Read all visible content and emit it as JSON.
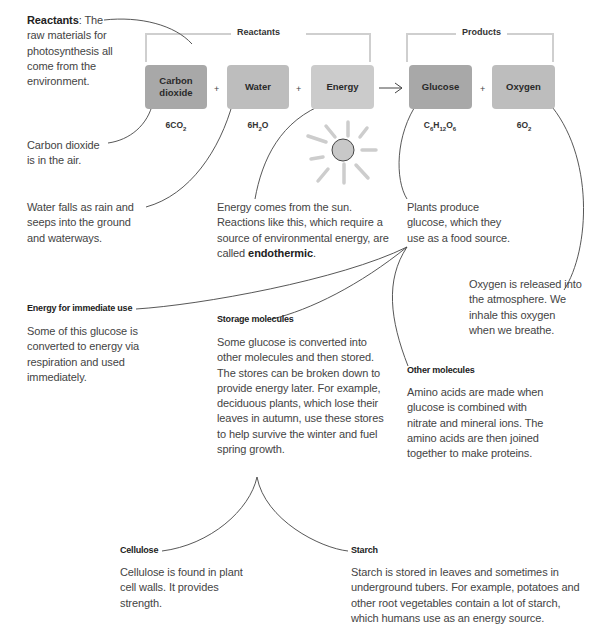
{
  "groups": {
    "reactants_label": "Reactants",
    "products_label": "Products"
  },
  "equation": {
    "boxes": [
      {
        "label": "Carbon dioxide",
        "line1": "Carbon",
        "line2": "dioxide",
        "formula_main": "6CO",
        "formula_sub": "2"
      },
      {
        "label": "Water",
        "formula_a": "6H",
        "formula_sub": "2",
        "formula_b": "O"
      },
      {
        "label": "Energy"
      },
      {
        "label": "Glucose",
        "formula": "C6H12O6"
      },
      {
        "label": "Oxygen",
        "formula_main": "6O",
        "formula_sub": "2"
      }
    ],
    "plus": "+",
    "arrow": "→",
    "colors": {
      "dark": "#a8a8a8",
      "mid": "#bdbdbd",
      "light": "#cbcbcb",
      "sun": "#c8c8c8"
    }
  },
  "annotations": {
    "reactants_term": "Reactants",
    "reactants_rest": ": The raw materials for photosynthesis all come from the environment.",
    "co2": "Carbon dioxide is in the air.",
    "water": "Water falls as rain and seeps into the ground and waterways.",
    "energy_pre": "Energy comes from the sun. Reactions like this, which require a source of environmental energy, are called ",
    "energy_term": "endothermic",
    "energy_post": ".",
    "glucose": "Plants produce glucose, which they use as a food source.",
    "oxygen": "Oxygen is released into the atmosphere. We inhale this oxygen when we breathe."
  },
  "uses": [
    {
      "heading": "Energy for immediate use",
      "text": "Some of this glucose is converted to energy via respiration and used immediately."
    },
    {
      "heading": "Storage molecules",
      "text": "Some glucose is converted into other molecules and then stored. The stores can be broken down to provide energy later. For example, deciduous plants, which lose their leaves in autumn, use these stores to help survive the winter and fuel spring growth."
    },
    {
      "heading": "Other molecules",
      "text": "Amino acids are made when glucose is combined with nitrate and mineral ions. The amino acids are then joined together to make proteins."
    },
    {
      "heading": "Cellulose",
      "text": "Cellulose is found in plant cell walls. It provides strength."
    },
    {
      "heading": "Starch",
      "text": "Starch is stored in leaves and sometimes in underground tubers. For example, potatoes and other root vegetables contain a lot of starch, which humans use as an energy source."
    }
  ]
}
